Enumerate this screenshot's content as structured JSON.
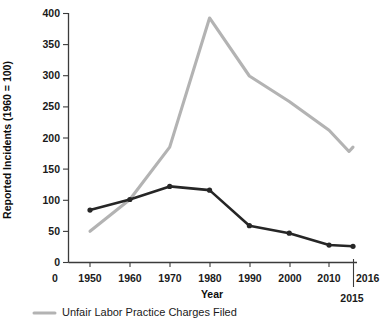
{
  "chart_data": {
    "type": "line",
    "title": "",
    "xlabel": "Year",
    "ylabel": "Reported Incidents (1960 = 100)",
    "xlim": [
      1940,
      2016
    ],
    "ylim": [
      0,
      400
    ],
    "grid": false,
    "legend_position": "bottom-left",
    "x_tick_labels": [
      "0",
      "1950",
      "1960",
      "1970",
      "1980",
      "1990",
      "2000",
      "2010",
      "2016"
    ],
    "x_tick_values": [
      1942,
      1950,
      1960,
      1970,
      1980,
      1990,
      2000,
      2010,
      2016
    ],
    "x_extra_label": "2015",
    "y_tick_labels": [
      "0",
      "50",
      "100",
      "150",
      "200",
      "250",
      "300",
      "350",
      "400"
    ],
    "y_tick_values": [
      0,
      50,
      100,
      150,
      200,
      250,
      300,
      350,
      400
    ],
    "series": [
      {
        "name": "Unfair Labor Practice Charges Filed",
        "color": "#b3b3b3",
        "has_markers": false,
        "x": [
          1950,
          1960,
          1970,
          1980,
          1990,
          2000,
          2010,
          2015,
          2016
        ],
        "values": [
          50,
          101,
          185,
          392,
          299,
          258,
          212,
          178,
          185
        ]
      },
      {
        "name": "Work Stoppages",
        "color": "#262626",
        "has_markers": true,
        "x": [
          1950,
          1960,
          1970,
          1980,
          1990,
          2000,
          2010,
          2016
        ],
        "values": [
          84,
          101,
          122,
          116,
          59,
          47,
          28,
          26
        ]
      }
    ],
    "legend": [
      {
        "label": "Unfair Labor Practice Charges Filed",
        "color": "#b3b3b3"
      }
    ]
  },
  "axis": {
    "y_title": "Reported Incidents (1960 = 100)",
    "x_title": "Year"
  }
}
